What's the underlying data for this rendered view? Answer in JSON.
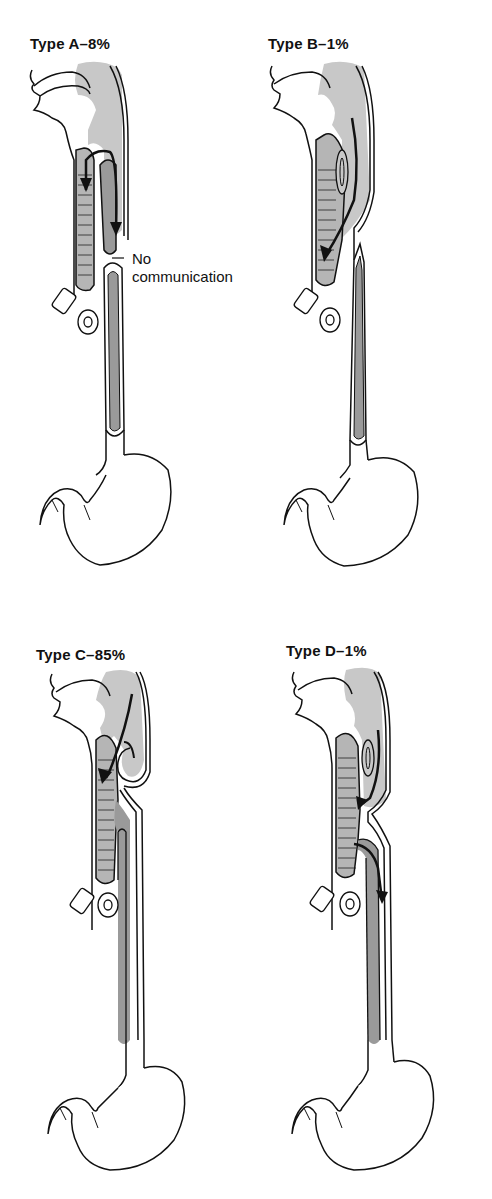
{
  "figure": {
    "panels": [
      {
        "id": "A",
        "title": "Type A–8%",
        "type_label": "Type A",
        "percent": "8%",
        "annotation": [
          "No",
          "communication"
        ]
      },
      {
        "id": "B",
        "title": "Type B–1%",
        "type_label": "Type B",
        "percent": "1%"
      },
      {
        "id": "C",
        "title": "Type C–85%",
        "type_label": "Type C",
        "percent": "85%"
      },
      {
        "id": "D",
        "title": "Type D–1%",
        "type_label": "Type D",
        "percent": "1%"
      }
    ],
    "colors": {
      "outline": "#111111",
      "pharynx_fill": "#c8c8c8",
      "esophagus_fill": "#9a9a9a",
      "trachea_fill": "#b5b5b5",
      "background": "#ffffff"
    }
  }
}
